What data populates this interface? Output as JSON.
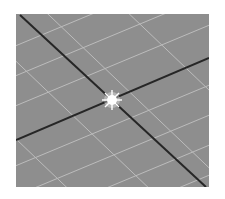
{
  "viewport": {
    "name": "3d-perspective-viewport",
    "background": "#8e8e8e",
    "grid_color": "#c8c8c8",
    "axis_color": "#2a2a2a",
    "origin_marker_color": "#ffffff"
  }
}
